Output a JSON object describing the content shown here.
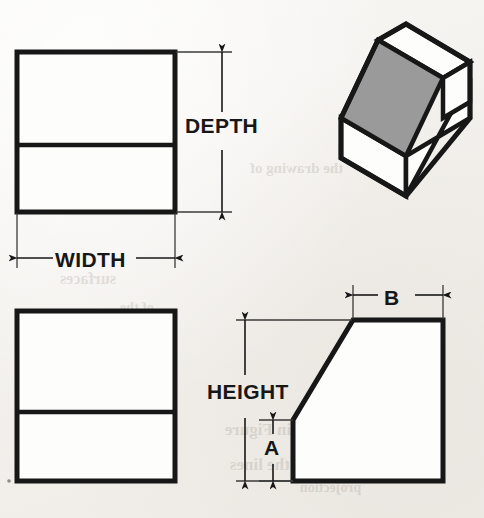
{
  "document": {
    "kind": "engineering-drawing",
    "description": "Orthographic multiview drawing of a chamfered rectangular block with pictorial isometric view",
    "background_color": "#f3f1ed",
    "line_color": "#171717",
    "shaded_face_color": "#9a9a9a"
  },
  "labels": {
    "depth": "DEPTH",
    "width": "WIDTH",
    "height": "HEIGHT",
    "a": "A",
    "b": "B"
  },
  "views": {
    "top_view": {
      "name": "top-view",
      "outline": "rectangle",
      "has_horizontal_divider": true,
      "dimensions_shown": [
        "WIDTH",
        "DEPTH"
      ]
    },
    "front_view": {
      "name": "front-view",
      "outline": "rectangle",
      "has_horizontal_divider": true,
      "dimensions_shown": []
    },
    "side_view": {
      "name": "side-view",
      "outline": "chamfered-rectangle",
      "has_horizontal_divider": false,
      "dimensions_shown": [
        "HEIGHT",
        "A",
        "B"
      ]
    },
    "isometric_view": {
      "name": "isometric-pictorial-view",
      "outline": "chamfered-block",
      "shaded_face": "inclined-chamfer-face"
    }
  },
  "dimensions": [
    {
      "id": "depth",
      "label": "DEPTH",
      "orientation": "vertical",
      "view": "top-view",
      "arrows": "both-ends"
    },
    {
      "id": "width",
      "label": "WIDTH",
      "orientation": "horizontal",
      "view": "top-view",
      "arrows": "both-ends"
    },
    {
      "id": "height",
      "label": "HEIGHT",
      "orientation": "vertical",
      "view": "side-view",
      "arrows": "both-ends"
    },
    {
      "id": "a",
      "label": "A",
      "orientation": "vertical",
      "view": "side-view",
      "arrows": "both-ends"
    },
    {
      "id": "b",
      "label": "B",
      "orientation": "horizontal",
      "view": "side-view",
      "arrows": "both-ends"
    }
  ],
  "bleed_text": [
    {
      "text": "the drawing of",
      "x": 250,
      "y": 160,
      "size": 15
    },
    {
      "text": "shown in Figure",
      "x": 225,
      "y": 420,
      "size": 17
    },
    {
      "text": "locate the lines",
      "x": 230,
      "y": 455,
      "size": 17
    },
    {
      "text": "projection",
      "x": 300,
      "y": 480,
      "size": 14
    },
    {
      "text": "surfaces",
      "x": 60,
      "y": 270,
      "size": 16
    },
    {
      "text": "of the",
      "x": 120,
      "y": 300,
      "size": 14
    }
  ]
}
